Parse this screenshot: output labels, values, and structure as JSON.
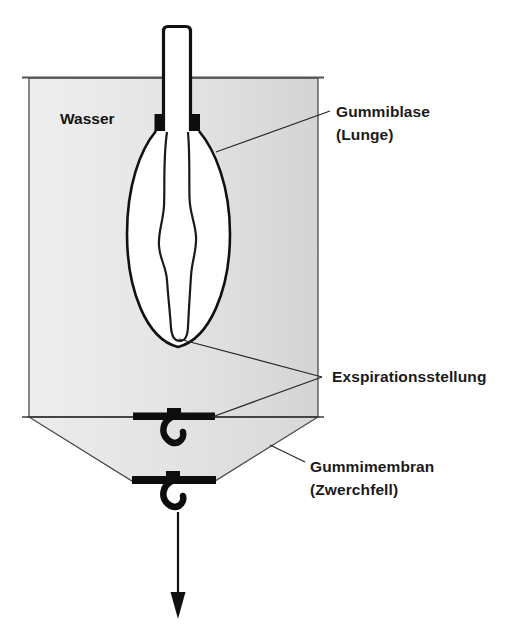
{
  "figure": {
    "language": "de"
  },
  "labels": {
    "water": "Wasser",
    "balloon_line1": "Gummiblase",
    "balloon_line2": "(Lunge)",
    "expiration": "Exspirationsstellung",
    "membrane_line1": "Gummimembran",
    "membrane_line2": "(Zwerchfell)"
  },
  "colors": {
    "water_fill_light": "#ededed",
    "water_fill_mid": "#e3e3e3",
    "water_fill_dark": "#d6d6d6",
    "outline": "#4a4a4a",
    "ink": "#111111",
    "text": "#1a1a1a",
    "balloon_fill": "#ffffff",
    "background": "#ffffff"
  },
  "parts": [
    {
      "name": "glass-tube",
      "description": "Offenes Glasrohr (Luftröhre)"
    },
    {
      "name": "rubber-collar",
      "description": "Schwarze Gummimanschette am Rohr"
    },
    {
      "name": "rubber-balloon",
      "description": "Gummiblase (Lunge) in Inspirationsform"
    },
    {
      "name": "collapsed-balloon",
      "description": "Gummiblase in Exspirationsstellung"
    },
    {
      "name": "water-chamber",
      "description": "Mit Wasser gefüllte Glocke"
    },
    {
      "name": "membrane-upper",
      "description": "Gummimembran in Exspirationsstellung"
    },
    {
      "name": "membrane-lower",
      "description": "Gummimembran heruntergezogen (Inspiration)"
    },
    {
      "name": "pull-arrow",
      "description": "Zugrichtung nach unten"
    }
  ]
}
